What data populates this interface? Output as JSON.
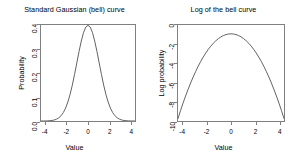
{
  "figure": {
    "background": "#ffffff",
    "line_color": "#4d4d4d",
    "axis_color": "#808080",
    "text_color": "#000000"
  },
  "panels": [
    {
      "key": "gaussian",
      "title": "Standard Gaussian (bell) curve",
      "xlabel": "Value",
      "ylabel": "Probability",
      "xticks": [
        "-4",
        "-2",
        "0",
        "2",
        "4"
      ],
      "yticks": [
        "0.0",
        "0.1",
        "0.2",
        "0.3",
        "0.4"
      ]
    },
    {
      "key": "log_gaussian",
      "title": "Log of the bell curve",
      "xlabel": "Value",
      "ylabel": "Log probability",
      "xticks": [
        "-4",
        "-2",
        "0",
        "2",
        "4"
      ],
      "yticks": [
        "-10",
        "-8",
        "-6",
        "-4",
        "-2",
        "0"
      ]
    }
  ],
  "chart_data": [
    {
      "type": "line",
      "title": "Standard Gaussian (bell) curve",
      "xlabel": "Value",
      "ylabel": "Probability",
      "xlim": [
        -4.2,
        4.2
      ],
      "ylim": [
        0.0,
        0.4
      ],
      "xticks": [
        -4,
        -2,
        0,
        2,
        4
      ],
      "yticks": [
        0.0,
        0.1,
        0.2,
        0.3,
        0.4
      ],
      "grid": false,
      "legend": null,
      "series": [
        {
          "name": "dnorm(x, 0, 1)",
          "x": [
            -4.2,
            -4.0,
            -3.8,
            -3.6,
            -3.4,
            -3.2,
            -3.0,
            -2.8,
            -2.6,
            -2.4,
            -2.2,
            -2.0,
            -1.8,
            -1.6,
            -1.4,
            -1.2,
            -1.0,
            -0.8,
            -0.6,
            -0.4,
            -0.2,
            0.0,
            0.2,
            0.4,
            0.6,
            0.8,
            1.0,
            1.2,
            1.4,
            1.6,
            1.8,
            2.0,
            2.2,
            2.4,
            2.6,
            2.8,
            3.0,
            3.2,
            3.4,
            3.6,
            3.8,
            4.0,
            4.2
          ],
          "values": [
            0.0001,
            0.0001,
            0.0003,
            0.0006,
            0.0012,
            0.0024,
            0.0044,
            0.0079,
            0.0136,
            0.0224,
            0.0355,
            0.054,
            0.079,
            0.1109,
            0.1497,
            0.1942,
            0.242,
            0.2897,
            0.3332,
            0.3683,
            0.391,
            0.3989,
            0.391,
            0.3683,
            0.3332,
            0.2897,
            0.242,
            0.1942,
            0.1497,
            0.1109,
            0.079,
            0.054,
            0.0355,
            0.0224,
            0.0136,
            0.0079,
            0.0044,
            0.0024,
            0.0012,
            0.0006,
            0.0003,
            0.0001,
            0.0001
          ]
        }
      ]
    },
    {
      "type": "line",
      "title": "Log of the bell curve",
      "xlabel": "Value",
      "ylabel": "Log probability",
      "xlim": [
        -4.2,
        4.2
      ],
      "ylim": [
        -10,
        0
      ],
      "xticks": [
        -4,
        -2,
        0,
        2,
        4
      ],
      "yticks": [
        -10,
        -8,
        -6,
        -4,
        -2,
        0
      ],
      "grid": false,
      "legend": null,
      "series": [
        {
          "name": "log(dnorm(x, 0, 1))",
          "x": [
            -4.2,
            -4.0,
            -3.8,
            -3.6,
            -3.4,
            -3.2,
            -3.0,
            -2.8,
            -2.6,
            -2.4,
            -2.2,
            -2.0,
            -1.8,
            -1.6,
            -1.4,
            -1.2,
            -1.0,
            -0.8,
            -0.6,
            -0.4,
            -0.2,
            0.0,
            0.2,
            0.4,
            0.6,
            0.8,
            1.0,
            1.2,
            1.4,
            1.6,
            1.8,
            2.0,
            2.2,
            2.4,
            2.6,
            2.8,
            3.0,
            3.2,
            3.4,
            3.6,
            3.8,
            4.0,
            4.2
          ],
          "values": [
            -9.74,
            -8.92,
            -8.14,
            -7.4,
            -6.7,
            -6.04,
            -5.42,
            -4.84,
            -4.3,
            -3.8,
            -3.34,
            -2.92,
            -2.54,
            -2.2,
            -1.9,
            -1.64,
            -1.42,
            -1.24,
            -1.1,
            -1.0,
            -0.94,
            -0.92,
            -0.94,
            -1.0,
            -1.1,
            -1.24,
            -1.42,
            -1.64,
            -1.9,
            -2.2,
            -2.54,
            -2.92,
            -3.34,
            -3.8,
            -4.3,
            -4.84,
            -5.42,
            -6.04,
            -6.7,
            -7.4,
            -8.14,
            -8.92,
            -9.74
          ]
        }
      ]
    }
  ]
}
